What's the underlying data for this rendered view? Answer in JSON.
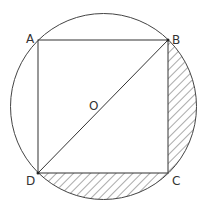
{
  "diagram": {
    "type": "geometry",
    "labels": {
      "A": "A",
      "B": "B",
      "C": "C",
      "D": "D",
      "O": "O"
    },
    "colors": {
      "stroke": "#333333",
      "hatch": "#555555",
      "background": "#ffffff"
    }
  }
}
